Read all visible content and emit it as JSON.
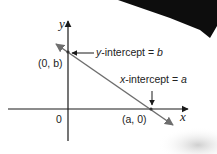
{
  "diagram": {
    "axes": {
      "x_label": "x",
      "y_label": "y",
      "origin_label": "0"
    },
    "points": {
      "y_intercept_point": "(0, b)",
      "x_intercept_point": "(a, 0)"
    },
    "annotations": {
      "y_intercept": {
        "prefix": "y",
        "text": "-intercept = ",
        "var": "b"
      },
      "x_intercept": {
        "prefix": "x",
        "text": "-intercept = ",
        "var": "a"
      }
    },
    "colors": {
      "line": "#6e6e6e",
      "axes": "#1a1a1a",
      "text": "#222222"
    }
  }
}
